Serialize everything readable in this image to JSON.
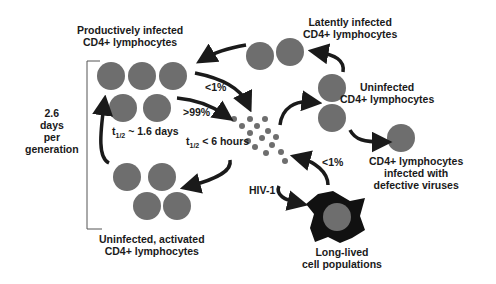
{
  "labels": {
    "productively_infected_1": "Productively infected",
    "productively_infected_2": "CD4+ lymphocytes",
    "latently_infected_1": "Latently infected",
    "latently_infected_2": "CD4+ lymphocytes",
    "uninfected_1": "Uninfected",
    "uninfected_2": "CD4+ lymphocytes",
    "defective_1": "CD4+ lymphocytes",
    "defective_2": "infected with",
    "defective_3": "defective viruses",
    "activated_1": "Uninfected, activated",
    "activated_2": "CD4+ lymphocytes",
    "longlived_1": "Long-lived",
    "longlived_2": "cell populations",
    "generation_1": "2.6",
    "generation_2": "days",
    "generation_3": "per",
    "generation_4": "generation",
    "pct_lt1_top": "<1%",
    "pct_gt99": ">99%",
    "pct_lt1_bottom": "<1%",
    "hiv": "HIV-1",
    "half_life_cells_t": "t",
    "half_life_cells_sub": "1/2",
    "half_life_cells_val": " ~ 1.6 days",
    "half_life_virus_t": "t",
    "half_life_virus_sub": "1/2",
    "half_life_virus_val": " < 6 hours"
  },
  "colors": {
    "cell": "#6e6e6e",
    "arrow": "#1a1a1a",
    "macrophage": "#111111"
  }
}
